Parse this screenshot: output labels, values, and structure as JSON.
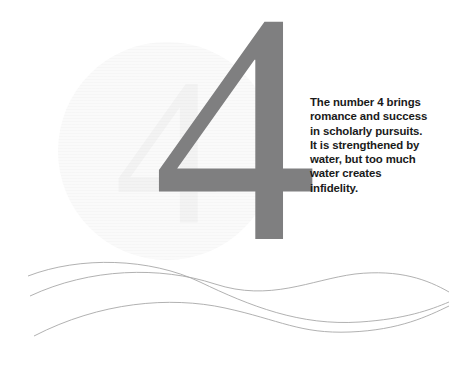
{
  "card": {
    "numeral": "4",
    "watermark_glyph": "4",
    "body_text": "The number 4 brings romance and success in scholarly pursuits. It is strengthened by water, but too much water creates infidelity.",
    "colors": {
      "numeral_gray": "#7f7f80",
      "text_black": "#1a1a1a",
      "wave_gray": "#a8a8a8",
      "watermark_gray": "#f3f3f3",
      "background": "#ffffff"
    },
    "decoration": {
      "wave_line_count": 3,
      "watermark_shape": "circle"
    }
  }
}
